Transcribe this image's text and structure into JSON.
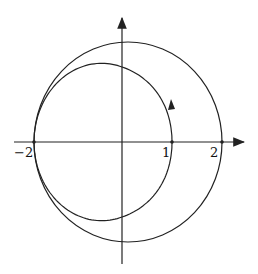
{
  "diagram": {
    "type": "polar-curve",
    "axes": {
      "x_arrow": true,
      "y_arrow": true
    },
    "tick_labels": {
      "neg_two": "−2",
      "one": "1",
      "two": "2"
    },
    "curves": [
      {
        "name": "outer-circle",
        "radius": 2
      },
      {
        "name": "inner-curve",
        "equation": "r = 1.5 - 0.5cos(theta)",
        "passes_through": [
          [
            1,
            0
          ],
          [
            -2,
            0
          ]
        ]
      }
    ],
    "colors": {
      "stroke": "#222222",
      "background": "#ffffff"
    }
  }
}
